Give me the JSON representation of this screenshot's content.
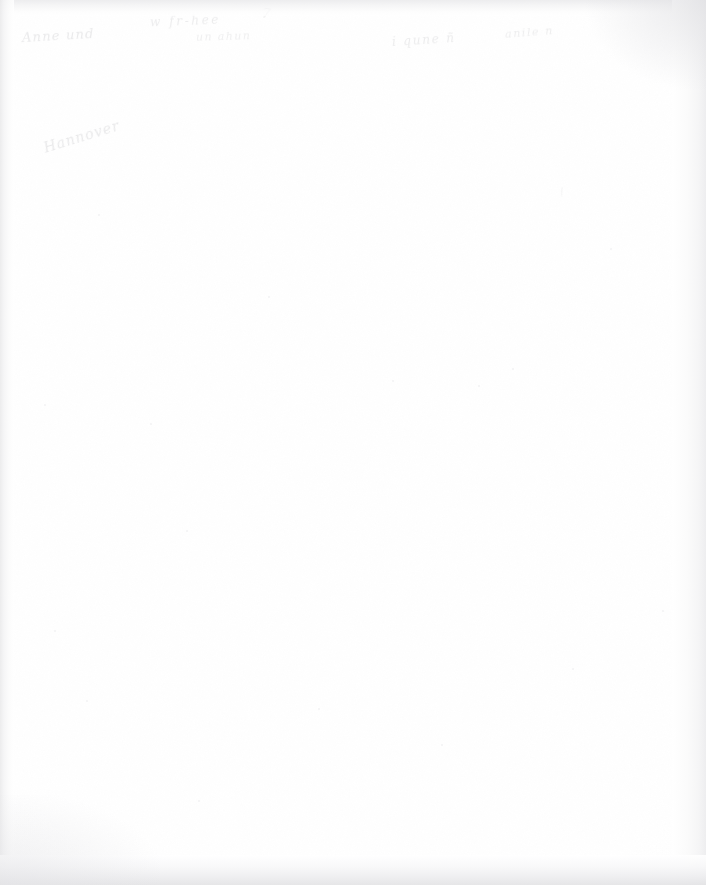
{
  "document": {
    "type": "scanned-page",
    "page_width": 706,
    "page_height": 885,
    "condition": "blank page with faded, largely illegible handwritten annotations",
    "paper_color": "#ffffff",
    "ink_color": "#b9b9bd",
    "edge_shadow_color": "#e7e7e9"
  },
  "annotations": {
    "top_line_left": "Anne und",
    "top_line_mid": "w fr-hee",
    "top_line_mid2": "un ahun",
    "top_line_right": "i qune ñ",
    "top_line_right2": "anile n",
    "top_tick": "7",
    "isolated_word": "Hannover",
    "right_speck": "/",
    "footer_line": "Die Handschrift ist verblasst und kaum lesbar",
    "footer_line_secondary": "unleserlich"
  },
  "specks": [
    {
      "x": 44,
      "y": 404,
      "size": 2
    },
    {
      "x": 392,
      "y": 380,
      "size": 2
    },
    {
      "x": 478,
      "y": 385,
      "size": 2
    },
    {
      "x": 512,
      "y": 368,
      "size": 2
    },
    {
      "x": 186,
      "y": 530,
      "size": 2
    },
    {
      "x": 150,
      "y": 423,
      "size": 2
    },
    {
      "x": 54,
      "y": 630,
      "size": 2
    },
    {
      "x": 662,
      "y": 610,
      "size": 2
    },
    {
      "x": 572,
      "y": 668,
      "size": 2
    },
    {
      "x": 318,
      "y": 708,
      "size": 2
    },
    {
      "x": 198,
      "y": 800,
      "size": 2
    },
    {
      "x": 610,
      "y": 248,
      "size": 2
    },
    {
      "x": 98,
      "y": 214,
      "size": 2
    },
    {
      "x": 268,
      "y": 296,
      "size": 2
    },
    {
      "x": 441,
      "y": 744,
      "size": 2
    },
    {
      "x": 86,
      "y": 700,
      "size": 2
    }
  ]
}
